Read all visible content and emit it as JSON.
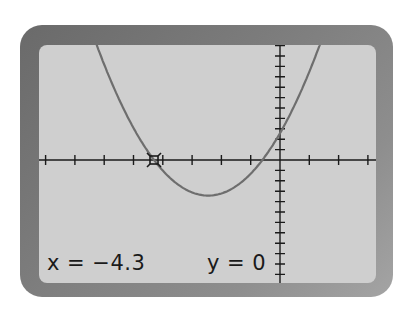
{
  "calculator": {
    "readout_x": "x = −4.3",
    "readout_y": "y = 0",
    "colors": {
      "frame": "#7a7a7a",
      "screen": "#cfcfcf",
      "axes": "#1a1a1a",
      "curve": "#6e6e6e"
    }
  },
  "chart_data": {
    "type": "line",
    "title": "",
    "xlabel": "",
    "ylabel": "",
    "window": {
      "xmin": -8.1,
      "xmax": 3.3,
      "ymin": -11.7,
      "ymax": 11.0
    },
    "x_tick_step": 1,
    "y_tick_step": 1,
    "grid": false,
    "series": [
      {
        "name": "parabola",
        "equation": "y = (x + 4.3)(x + 0.6)",
        "x": [
          -6.2,
          -5.5,
          -5.0,
          -4.3,
          -3.5,
          -2.45,
          -1.5,
          -0.6,
          0,
          0.5,
          1.0,
          1.4
        ],
        "y": [
          10.7,
          5.9,
          3.1,
          0,
          -2.3,
          -3.4,
          -2.5,
          0,
          2.6,
          5.3,
          8.5,
          11.0
        ]
      }
    ],
    "trace_cursor": {
      "x": -4.3,
      "y": 0
    },
    "annotations": [
      "x = −4.3",
      "y = 0"
    ]
  }
}
